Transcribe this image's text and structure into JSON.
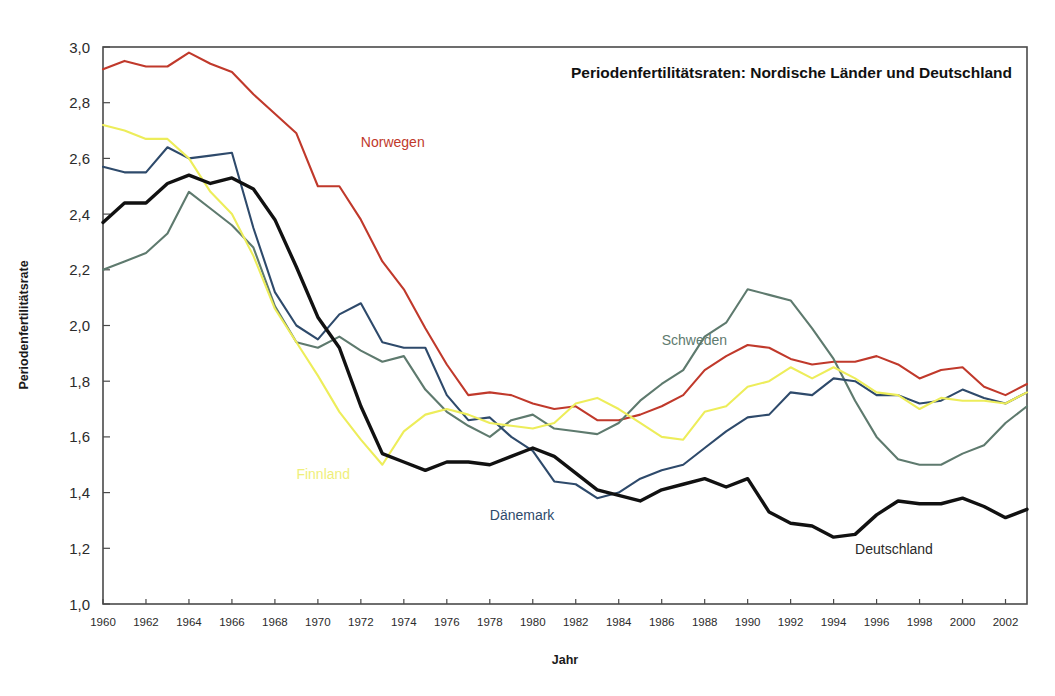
{
  "chart_data": {
    "type": "line",
    "title": "Periodenfertilitätsraten: Nordische Länder und Deutschland",
    "xlabel": "Jahr",
    "ylabel": "Periodenfertilitätsrate",
    "xlim": [
      1960,
      2003
    ],
    "ylim": [
      1.0,
      3.0
    ],
    "ytick_labels": [
      "3,0",
      "2,8",
      "2,6",
      "2,4",
      "2,2",
      "2,0",
      "1,8",
      "1,6",
      "1,4",
      "1,2",
      "1,0"
    ],
    "ytick_values": [
      3.0,
      2.8,
      2.6,
      2.4,
      2.2,
      2.0,
      1.8,
      1.6,
      1.4,
      1.2,
      1.0
    ],
    "xtick_labels": [
      "1960",
      "1962",
      "1964",
      "1966",
      "1968",
      "1970",
      "1972",
      "1974",
      "1976",
      "1978",
      "1980",
      "1982",
      "1984",
      "1986",
      "1988",
      "1990",
      "1992",
      "1994",
      "1996",
      "1998",
      "2000",
      "2002"
    ],
    "xtick_values": [
      1960,
      1962,
      1964,
      1966,
      1968,
      1970,
      1972,
      1974,
      1976,
      1978,
      1980,
      1982,
      1984,
      1986,
      1988,
      1990,
      1992,
      1994,
      1996,
      1998,
      2000,
      2002
    ],
    "grid": false,
    "legend": "inline-annotations",
    "x": [
      1960,
      1961,
      1962,
      1963,
      1964,
      1965,
      1966,
      1967,
      1968,
      1969,
      1970,
      1971,
      1972,
      1973,
      1974,
      1975,
      1976,
      1977,
      1978,
      1979,
      1980,
      1981,
      1982,
      1983,
      1984,
      1985,
      1986,
      1987,
      1988,
      1989,
      1990,
      1991,
      1992,
      1993,
      1994,
      1995,
      1996,
      1997,
      1998,
      1999,
      2000,
      2001,
      2002,
      2003
    ],
    "series": [
      {
        "name": "Norwegen",
        "color": "#c0392b",
        "label_x": 1972,
        "label_y": 2.64,
        "values": [
          2.92,
          2.95,
          2.93,
          2.93,
          2.98,
          2.94,
          2.91,
          2.83,
          2.76,
          2.69,
          2.5,
          2.5,
          2.38,
          2.23,
          2.13,
          1.99,
          1.86,
          1.75,
          1.76,
          1.75,
          1.72,
          1.7,
          1.71,
          1.66,
          1.66,
          1.68,
          1.71,
          1.75,
          1.84,
          1.89,
          1.93,
          1.92,
          1.88,
          1.86,
          1.87,
          1.87,
          1.89,
          1.86,
          1.81,
          1.84,
          1.85,
          1.78,
          1.75,
          1.79
        ]
      },
      {
        "name": "Schweden",
        "color": "#5e7a6e",
        "label_x": 1986,
        "label_y": 1.93,
        "values": [
          2.2,
          2.23,
          2.26,
          2.33,
          2.48,
          2.42,
          2.36,
          2.28,
          2.07,
          1.94,
          1.92,
          1.96,
          1.91,
          1.87,
          1.89,
          1.77,
          1.69,
          1.64,
          1.6,
          1.66,
          1.68,
          1.63,
          1.62,
          1.61,
          1.65,
          1.73,
          1.79,
          1.84,
          1.96,
          2.01,
          2.13,
          2.11,
          2.09,
          1.99,
          1.88,
          1.73,
          1.6,
          1.52,
          1.5,
          1.5,
          1.54,
          1.57,
          1.65,
          1.71
        ]
      },
      {
        "name": "Dänemark",
        "color": "#2e4a6b",
        "label_x": 1978,
        "label_y": 1.3,
        "values": [
          2.57,
          2.55,
          2.55,
          2.64,
          2.6,
          2.61,
          2.62,
          2.35,
          2.12,
          2.0,
          1.95,
          2.04,
          2.08,
          1.94,
          1.92,
          1.92,
          1.75,
          1.66,
          1.67,
          1.6,
          1.55,
          1.44,
          1.43,
          1.38,
          1.4,
          1.45,
          1.48,
          1.5,
          1.56,
          1.62,
          1.67,
          1.68,
          1.76,
          1.75,
          1.81,
          1.8,
          1.75,
          1.75,
          1.72,
          1.73,
          1.77,
          1.74,
          1.72,
          1.76
        ]
      },
      {
        "name": "Finnland",
        "color": "#eded5a",
        "label_x": 1969,
        "label_y": 1.45,
        "values": [
          2.72,
          2.7,
          2.67,
          2.67,
          2.6,
          2.48,
          2.4,
          2.25,
          2.06,
          1.94,
          1.82,
          1.69,
          1.59,
          1.5,
          1.62,
          1.68,
          1.7,
          1.68,
          1.65,
          1.64,
          1.63,
          1.65,
          1.72,
          1.74,
          1.7,
          1.65,
          1.6,
          1.59,
          1.69,
          1.71,
          1.78,
          1.8,
          1.85,
          1.81,
          1.85,
          1.81,
          1.76,
          1.75,
          1.7,
          1.74,
          1.73,
          1.73,
          1.72,
          1.76
        ]
      },
      {
        "name": "Deutschland",
        "color": "#111111",
        "label_x": 1995,
        "label_y": 1.18,
        "values": [
          2.37,
          2.44,
          2.44,
          2.51,
          2.54,
          2.51,
          2.53,
          2.49,
          2.38,
          2.21,
          2.03,
          1.92,
          1.71,
          1.54,
          1.51,
          1.48,
          1.51,
          1.51,
          1.5,
          1.53,
          1.56,
          1.53,
          1.47,
          1.41,
          1.39,
          1.37,
          1.41,
          1.43,
          1.45,
          1.42,
          1.45,
          1.33,
          1.29,
          1.28,
          1.24,
          1.25,
          1.32,
          1.37,
          1.36,
          1.36,
          1.38,
          1.35,
          1.31,
          1.34
        ]
      }
    ]
  },
  "chart_labels": {
    "norwegen": "Norwegen",
    "schweden": "Schweden",
    "daenemark": "Dänemark",
    "finnland": "Finnland",
    "deutschland": "Deutschland"
  }
}
